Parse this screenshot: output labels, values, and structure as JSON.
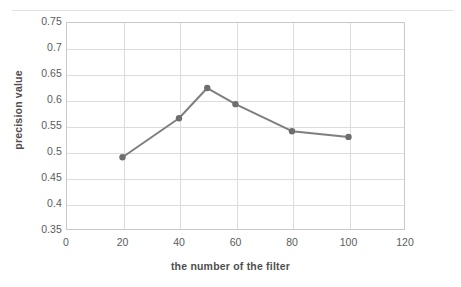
{
  "chart_data": {
    "type": "line",
    "title": "",
    "xlabel": "the number of  the filter",
    "ylabel": "precision value",
    "x": [
      20,
      40,
      50,
      60,
      80,
      100
    ],
    "values": [
      0.49,
      0.565,
      0.623,
      0.592,
      0.54,
      0.529
    ],
    "series": [
      {
        "name": "precision value",
        "x": [
          20,
          40,
          50,
          60,
          80,
          100
        ],
        "values": [
          0.49,
          0.565,
          0.623,
          0.592,
          0.54,
          0.529
        ]
      }
    ],
    "xlim": [
      0,
      120
    ],
    "ylim": [
      0.35,
      0.75
    ],
    "xticks": [
      0,
      20,
      40,
      60,
      80,
      100,
      120
    ],
    "xtick_labels": [
      "0",
      "20",
      "40",
      "60",
      "80",
      "100",
      "120"
    ],
    "yticks": [
      0.35,
      0.4,
      0.45,
      0.5,
      0.55,
      0.6,
      0.65,
      0.7,
      0.75
    ],
    "ytick_labels": [
      "0.35",
      "0.4",
      "0.45",
      "0.5",
      "0.55",
      "0.6",
      "0.65",
      "0.7",
      "0.75"
    ],
    "grid": "horizontal-and-vertical",
    "legend": "none",
    "marker": "circle",
    "line_color": "#7f7f7f",
    "marker_color": "#6e6e6e",
    "grid_color": "#dcdcdc",
    "frame_color": "#c9c9c9",
    "text_color": "#5c5c5c"
  }
}
